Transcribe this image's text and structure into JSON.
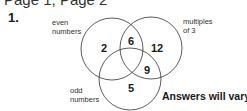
{
  "header": {
    "partial_text": "Page 1, Page 2",
    "question_number": "1."
  },
  "venn": {
    "sets": [
      {
        "name": "even numbers",
        "label_line1": "even",
        "label_line2": "numbers"
      },
      {
        "name": "multiples of 3",
        "label_line1": "multiples",
        "label_line2": "of 3"
      },
      {
        "name": "odd numbers",
        "label_line1": "odd",
        "label_line2": "numbers"
      }
    ],
    "regions": {
      "even_only": "2",
      "even_and_multiples": "6",
      "multiples_only": "12",
      "multiples_and_odd": "9",
      "odd_only": "5"
    },
    "stroke_color": "#333333"
  },
  "note": "Answers will vary."
}
